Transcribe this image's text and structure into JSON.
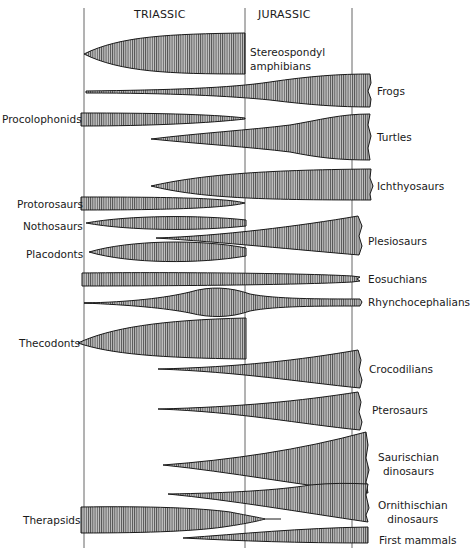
{
  "diagram": {
    "periods": [
      {
        "label": "TRIASSIC",
        "x": 134,
        "y": 8
      },
      {
        "label": "JURASSIC",
        "x": 258,
        "y": 8
      }
    ],
    "boundaries_x": [
      84,
      245,
      352
    ],
    "boundary_top": 8,
    "boundary_bottom": 548,
    "colors": {
      "ink": "#1a1a1a",
      "fill": "#b4b4b4",
      "hatch": "#2a2a2a",
      "background": "#ffffff"
    },
    "taxa": [
      {
        "id": "stereospondyl",
        "lines": [
          "Stereospondyl",
          "amphibians"
        ],
        "label_x": 250,
        "label_y": 45,
        "align": "left"
      },
      {
        "id": "frogs",
        "lines": [
          "Frogs"
        ],
        "label_x": 377,
        "label_y": 84,
        "align": "left"
      },
      {
        "id": "procolophonids",
        "lines": [
          "Procolophonids"
        ],
        "label_x": 2,
        "label_y": 112,
        "align": "left"
      },
      {
        "id": "turtles",
        "lines": [
          "Turtles"
        ],
        "label_x": 377,
        "label_y": 130,
        "align": "left"
      },
      {
        "id": "ichthyosaurs",
        "lines": [
          "Ichthyosaurs"
        ],
        "label_x": 377,
        "label_y": 179,
        "align": "left"
      },
      {
        "id": "protorosaurs",
        "lines": [
          "Protorosaurs"
        ],
        "label_x": 17,
        "label_y": 197,
        "align": "left"
      },
      {
        "id": "nothosaurs",
        "lines": [
          "Nothosaurs"
        ],
        "label_x": 23,
        "label_y": 219,
        "align": "left"
      },
      {
        "id": "placodonts",
        "lines": [
          "Placodonts"
        ],
        "label_x": 26,
        "label_y": 247,
        "align": "left"
      },
      {
        "id": "plesiosaurs",
        "lines": [
          "Plesiosaurs"
        ],
        "label_x": 368,
        "label_y": 234,
        "align": "left"
      },
      {
        "id": "eosuchians",
        "lines": [
          "Eosuchians"
        ],
        "label_x": 368,
        "label_y": 272,
        "align": "left"
      },
      {
        "id": "rhynchocephalians",
        "lines": [
          "Rhynchocephalians"
        ],
        "label_x": 368,
        "label_y": 295,
        "align": "left"
      },
      {
        "id": "thecodonts",
        "lines": [
          "Thecodonts"
        ],
        "label_x": 19,
        "label_y": 336,
        "align": "left"
      },
      {
        "id": "crocodilians",
        "lines": [
          "Crocodilians"
        ],
        "label_x": 369,
        "label_y": 362,
        "align": "left"
      },
      {
        "id": "pterosaurs",
        "lines": [
          "Pterosaurs"
        ],
        "label_x": 372,
        "label_y": 403,
        "align": "left"
      },
      {
        "id": "saurischian",
        "lines": [
          "Saurischian",
          "dinosaurs"
        ],
        "label_x": 378,
        "label_y": 450,
        "align": "center"
      },
      {
        "id": "ornithischian",
        "lines": [
          "Ornithischian",
          "dinosaurs"
        ],
        "label_x": 378,
        "label_y": 498,
        "align": "center"
      },
      {
        "id": "therapsids",
        "lines": [
          "Therapsids"
        ],
        "label_x": 23,
        "label_y": 513,
        "align": "left"
      },
      {
        "id": "first_mammals",
        "lines": [
          "First   mammals"
        ],
        "label_x": 379,
        "label_y": 533,
        "align": "left"
      }
    ],
    "shapes": [
      {
        "id": "stereospondyl",
        "d": "M84,54 C120,36 170,34 245,33 L245,74 C170,74 120,72 84,54 Z"
      },
      {
        "id": "frogs",
        "d": "M86,91 L86,93 C170,93 230,96 270,100 C310,105 340,107 370,107 L371,99 L368,91 L371,83 L370,74 C340,74 310,76 270,82 C230,88 170,90 86,91 Z"
      },
      {
        "id": "procolophonids",
        "d": "M81,113 C150,113 210,114 245,118 L245,119 C210,123 150,126 81,126 Z"
      },
      {
        "id": "turtles",
        "d": "M151,139 C200,133 250,130 290,125 C320,120 340,114 370,114 L368,125 L371,136 L368,148 L370,160 C340,160 320,158 290,152 C250,147 200,144 151,139 Z"
      },
      {
        "id": "ichthyosaurs",
        "d": "M151,186 C200,175 260,170 371,169 L370,178 L373,186 L370,194 L371,200 C260,200 200,198 151,186 Z"
      },
      {
        "id": "protorosaurs",
        "d": "M81,197 C170,197 225,198 245,203 C225,208 170,210 81,210 Z"
      },
      {
        "id": "nothosaurs",
        "d": "M86,223 C130,215 200,215 246,220 L246,226 C200,231 130,231 86,223 Z"
      },
      {
        "id": "placodonts",
        "d": "M89,252 C130,240 200,239 246,248 L246,256 C200,264 130,264 89,252 Z"
      },
      {
        "id": "plesiosaurs",
        "d": "M156,238 C220,236 300,226 358,216 L362,226 L359,236 L362,246 L359,255 C300,250 220,242 156,238 Z"
      },
      {
        "id": "eosuchians",
        "d": "M82,273 C160,272 300,273 352,276 L360,277 L357,279 L360,281 L352,282 C300,285 160,286 82,286 Z"
      },
      {
        "id": "rhynchocephalians",
        "d": "M84,303 C130,302 165,298 190,292 C210,286 230,287 250,294 C275,299 320,299 360,299 L362,302 L360,306 C320,306 275,306 250,311 C230,318 210,318 190,313 C165,308 130,305 84,303 Z"
      },
      {
        "id": "thecodonts",
        "d": "M78,343 C110,328 160,320 246,318 L246,359 C160,358 110,354 78,343 Z"
      },
      {
        "id": "crocodilians",
        "d": "M158,369 C240,367 300,360 358,350 L361,360 L359,370 L362,380 L360,388 C300,382 240,372 158,369 Z"
      },
      {
        "id": "pterosaurs",
        "d": "M158,409 C240,407 300,401 358,392 L361,402 L359,412 L362,422 L360,430 C300,424 240,412 158,409 Z"
      },
      {
        "id": "saurischian",
        "d": "M163,465 C230,460 300,450 366,432 L368,445 L366,458 L369,470 L366,482 L368,493 C300,485 230,472 163,465 Z"
      },
      {
        "id": "ornithischian",
        "d": "M168,494 C230,493 280,490 310,485 C330,483 350,483 368,484 L366,495 L369,508 L366,515 L368,522 C300,512 230,500 168,494 Z"
      },
      {
        "id": "therapsids",
        "d": "M81,507 C150,506 200,508 230,512 C250,516 262,518 265,519 C262,520 250,523 230,526 C200,531 150,533 81,533 Z"
      },
      {
        "id": "first_mammals",
        "d": "M183,538 C240,534 300,528 368,527 L368,543 C300,543 240,541 183,538 Z"
      }
    ],
    "lines": [
      {
        "id": "therapsid-tail",
        "x1": 263,
        "y1": 519,
        "x2": 281,
        "y2": 519
      },
      {
        "id": "rhyncho-stem",
        "x1": 84,
        "y1": 303,
        "x2": 95,
        "y2": 303
      }
    ]
  }
}
